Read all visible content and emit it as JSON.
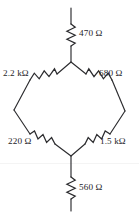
{
  "figure": {
    "type": "circuit-schematic",
    "background_color": "#ffffff",
    "ink_color": "#2b2b2e"
  },
  "labels": {
    "top_series": "470 Ω",
    "upper_left": "2.2 kΩ",
    "upper_right": "680 Ω",
    "lower_left": "220 Ω",
    "lower_right": "1.5 kΩ",
    "bottom_series": "560 Ω"
  },
  "components": [
    {
      "id": "R-top",
      "name": "top-series-resistor",
      "value": "470 Ω",
      "orientation": "vertical",
      "position": "top"
    },
    {
      "id": "R-upper-left",
      "name": "upper-left-bridge-resistor",
      "value": "2.2 kΩ",
      "orientation": "diagonal-down-left",
      "position": "bridge-upper-left"
    },
    {
      "id": "R-upper-right",
      "name": "upper-right-bridge-resistor",
      "value": "680 Ω",
      "orientation": "diagonal-down-right",
      "position": "bridge-upper-right"
    },
    {
      "id": "R-lower-left",
      "name": "lower-left-bridge-resistor",
      "value": "220 Ω",
      "orientation": "diagonal-down-right",
      "position": "bridge-lower-left"
    },
    {
      "id": "R-lower-right",
      "name": "lower-right-bridge-resistor",
      "value": "1.5 kΩ",
      "orientation": "diagonal-down-left",
      "position": "bridge-lower-right"
    },
    {
      "id": "R-bottom",
      "name": "bottom-series-resistor",
      "value": "560 Ω",
      "orientation": "vertical",
      "position": "bottom"
    }
  ],
  "nodes": {
    "top_terminal": {
      "x": 71,
      "y": 8
    },
    "bridge_top": {
      "x": 71,
      "y": 62
    },
    "bridge_left": {
      "x": 14,
      "y": 110
    },
    "bridge_right": {
      "x": 125,
      "y": 111
    },
    "bridge_bottom": {
      "x": 71,
      "y": 156
    },
    "bottom_terminal": {
      "x": 71,
      "y": 210
    }
  }
}
